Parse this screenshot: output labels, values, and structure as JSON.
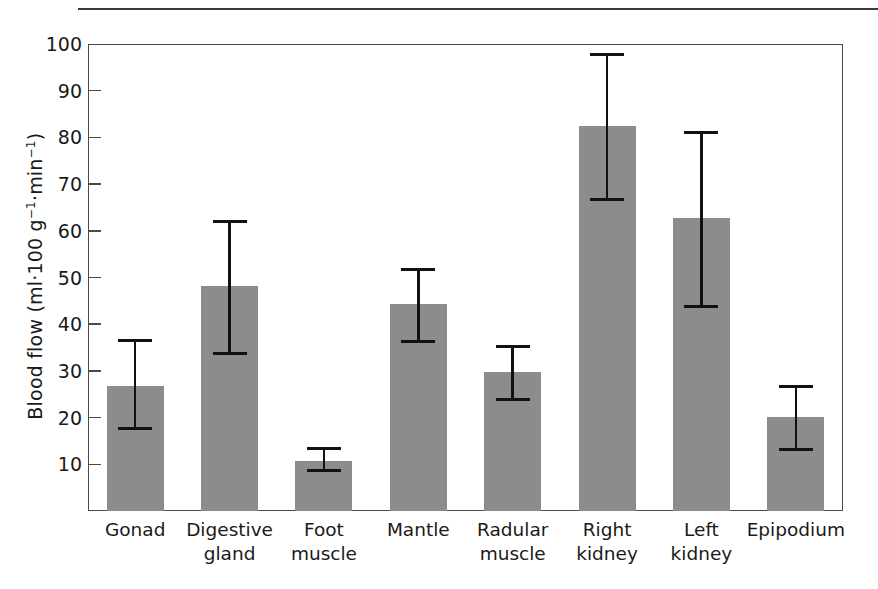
{
  "figure": {
    "y_axis_title_html": "Blood flow (ml·100 g⁻¹·min⁻¹)",
    "bar_color": "#8c8c8c",
    "error_bar_color": "#111111",
    "axis_color": "#4a4a4a"
  },
  "chart_data": {
    "type": "bar",
    "title": "",
    "subtitle": "",
    "xlabel": "",
    "ylabel": "Blood flow (ml·100 g⁻¹·min⁻¹)",
    "ylim": [
      0,
      100
    ],
    "ytick_values": [
      10,
      20,
      30,
      40,
      50,
      60,
      70,
      80,
      90,
      100
    ],
    "ytick_labels": [
      "10",
      "20",
      "30",
      "40",
      "50",
      "60",
      "70",
      "80",
      "90",
      "100"
    ],
    "grid": false,
    "legend": null,
    "error_bar_type": "range",
    "categories": [
      "Gonad",
      "Digestive gland",
      "Foot muscle",
      "Mantle",
      "Radular muscle",
      "Right kidney",
      "Left kidney",
      "Epipodium"
    ],
    "category_label_lines": [
      [
        "Gonad",
        ""
      ],
      [
        "Digestive",
        "gland"
      ],
      [
        "Foot",
        "muscle"
      ],
      [
        "Mantle",
        ""
      ],
      [
        "Radular",
        "muscle"
      ],
      [
        "Right",
        "kidney"
      ],
      [
        "Left",
        "kidney"
      ],
      [
        "Epipodium",
        ""
      ]
    ],
    "values": [
      26.8,
      48.2,
      10.8,
      44.3,
      29.7,
      82.4,
      62.8,
      20.1
    ],
    "err_low": [
      17.6,
      33.8,
      8.6,
      36.4,
      23.8,
      66.8,
      43.8,
      13.1
    ],
    "err_high": [
      36.6,
      62.0,
      13.3,
      51.8,
      35.2,
      97.8,
      81.0,
      26.6
    ]
  }
}
